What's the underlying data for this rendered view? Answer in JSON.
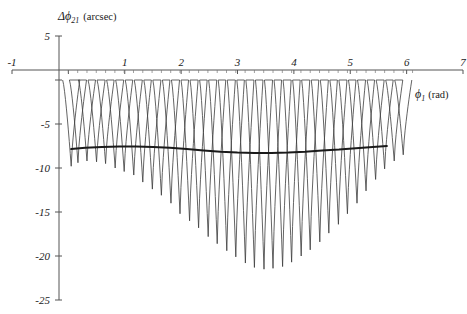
{
  "figure": {
    "background_color": "#ffffff",
    "line_color": "#3c3c3c",
    "envelope_color": "#1a1a1a",
    "axis_color": "#555555"
  },
  "labels": {
    "y_axis_symbol": "Δϕ",
    "y_axis_subscript": "21",
    "y_axis_unit": "(arcsec)",
    "x_axis_symbol": "ϕ",
    "x_axis_subscript": "1",
    "x_axis_unit": "(rad)"
  },
  "chart_data": {
    "type": "line",
    "title": "",
    "xlabel": "ϕ₁ (rad)",
    "ylabel": "Δϕ₂₁ (arcsec)",
    "xlim": [
      -1,
      7
    ],
    "ylim": [
      -25,
      5
    ],
    "xticks": [
      -1,
      0,
      1,
      2,
      3,
      4,
      5,
      6,
      7
    ],
    "xtick_labels": [
      "-1",
      "",
      "1",
      "2",
      "3",
      "4",
      "5",
      "6",
      "7"
    ],
    "yticks": [
      5,
      0,
      -5,
      -10,
      -15,
      -20,
      -25
    ],
    "ytick_labels": [
      "5",
      "",
      "-5",
      "-10",
      "-15",
      "-20",
      "-25"
    ],
    "grid": false,
    "legend": null,
    "minor_xticks_spacing": 0.165,
    "series": [
      {
        "name": "oscillatory-residual",
        "description": "Rapidly oscillating residual with peaks near 0 arcsec and downward spikes of varying depth",
        "line_width": 0.8,
        "oscillation_period": 0.33,
        "x_start": 0.0,
        "x_end": 6.1,
        "peak_value": 0.0,
        "spike_minima_x": [
          0.05,
          0.17,
          0.33,
          0.5,
          0.66,
          0.83,
          0.99,
          1.16,
          1.32,
          1.49,
          1.65,
          1.82,
          1.98,
          2.15,
          2.31,
          2.48,
          2.64,
          2.81,
          2.97,
          3.14,
          3.3,
          3.47,
          3.63,
          3.8,
          3.96,
          4.13,
          4.29,
          4.46,
          4.62,
          4.79,
          4.95,
          5.12,
          5.28,
          5.45,
          5.61,
          5.78,
          5.94
        ],
        "spike_minima_y": [
          -9.8,
          -9.4,
          -9.2,
          -9.3,
          -9.5,
          -10.0,
          -10.4,
          -10.8,
          -11.6,
          -12.4,
          -13.1,
          -14.0,
          -15.2,
          -16.0,
          -16.8,
          -17.8,
          -18.6,
          -19.4,
          -20.1,
          -20.8,
          -21.3,
          -21.5,
          -21.4,
          -21.2,
          -20.7,
          -20.0,
          -19.3,
          -18.4,
          -17.4,
          -16.4,
          -15.2,
          -14.0,
          -12.6,
          -11.3,
          -10.1,
          -9.2,
          -8.5
        ]
      },
      {
        "name": "mean-envelope",
        "description": "Thick smooth mean curve running near -8 arcsec",
        "line_width": 2.0,
        "x_start": 0.05,
        "x_end": 5.65,
        "x": [
          0.05,
          0.3,
          0.6,
          0.9,
          1.2,
          1.5,
          1.8,
          2.1,
          2.4,
          2.7,
          3.0,
          3.3,
          3.6,
          3.9,
          4.2,
          4.5,
          4.8,
          5.1,
          5.4,
          5.65
        ],
        "y": [
          -7.85,
          -7.7,
          -7.6,
          -7.55,
          -7.55,
          -7.6,
          -7.7,
          -7.85,
          -8.0,
          -8.15,
          -8.25,
          -8.3,
          -8.3,
          -8.25,
          -8.15,
          -8.0,
          -7.9,
          -7.75,
          -7.6,
          -7.5
        ]
      }
    ]
  }
}
